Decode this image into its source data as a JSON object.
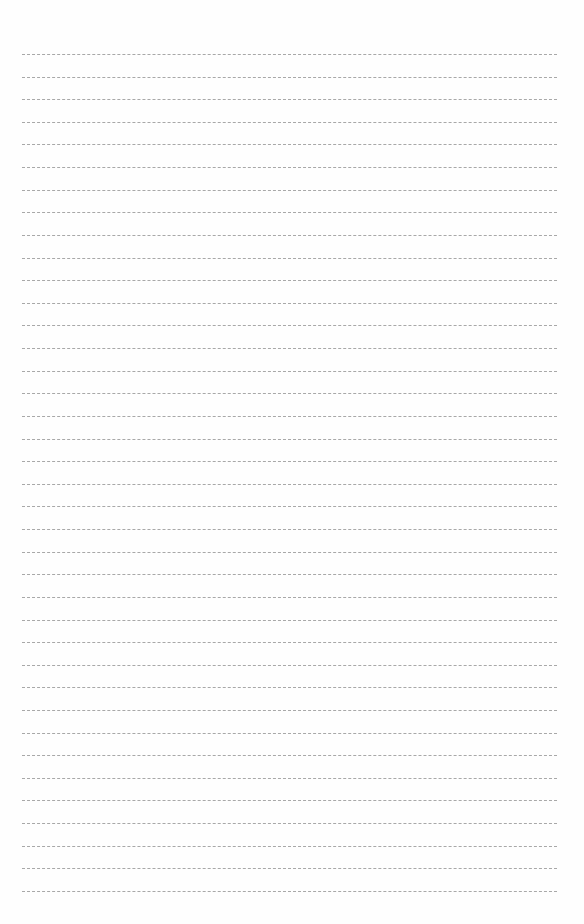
{
  "page": {
    "type": "lined-paper",
    "background": "#ffffff",
    "rule_color": "#a8a8a8",
    "rule_style": "dashed",
    "rule_count": 38,
    "first_rule_y": 54,
    "rule_spacing": 22.62,
    "rule_left": 22,
    "rule_right": 557,
    "text": []
  }
}
